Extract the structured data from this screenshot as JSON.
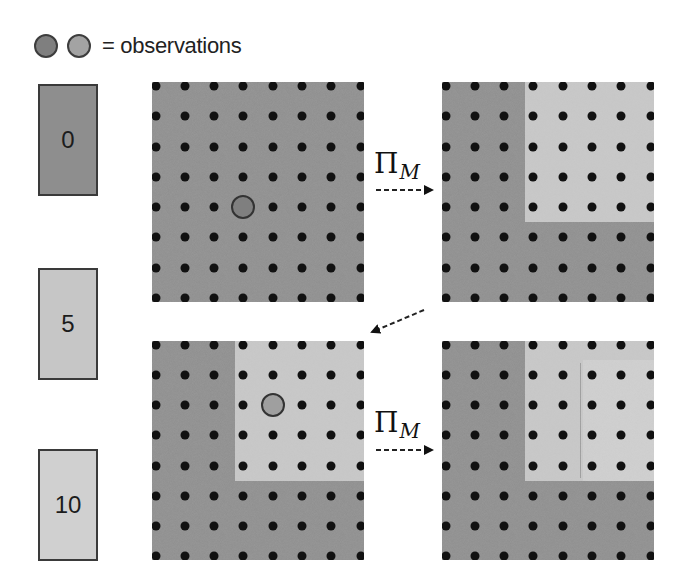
{
  "legend": {
    "markers": [
      {
        "name": "observation-marker-dark",
        "color": "#7f7f7f"
      },
      {
        "name": "observation-marker-light",
        "color": "#a3a3a3"
      }
    ],
    "text": "= observations"
  },
  "colors": {
    "value_0": "#8e8e8e",
    "value_5": "#c6c6c6",
    "value_10": "#d0d0d0",
    "grid_dark": "#8e8e8e",
    "grid_light": "#c9c9c9",
    "grid_lighter": "#d2d2d2",
    "dot": "#111111",
    "observation_dark": "#7f7f7f",
    "observation_light": "#9f9f9f"
  },
  "scale": [
    {
      "label": "0",
      "color": "#8e8e8e",
      "top": 84,
      "height": 112
    },
    {
      "label": "5",
      "color": "#c6c6c6",
      "top": 268,
      "height": 112
    },
    {
      "label": "10",
      "color": "#d0d0d0",
      "top": 449,
      "height": 112
    }
  ],
  "operator": {
    "symbol": "Π",
    "subscript": "M"
  },
  "grid": {
    "rows": 8,
    "cols": 8
  },
  "panels": [
    {
      "name": "panel-top-left",
      "position": "top-left",
      "x": 152,
      "y": 82,
      "w": 212,
      "h": 220,
      "base_color": "#8e8e8e",
      "regions": [],
      "observation": {
        "col": 4,
        "row": 5,
        "color": "#7f7f7f"
      }
    },
    {
      "name": "panel-top-right",
      "position": "top-right",
      "x": 442,
      "y": 82,
      "w": 212,
      "h": 220,
      "base_color": "#8e8e8e",
      "regions": [
        {
          "col_start": 3.7,
          "col_end": 8.5,
          "row_start": 0,
          "row_end": 5.5,
          "color": "#c9c9c9"
        }
      ],
      "observation": null
    },
    {
      "name": "panel-bottom-left",
      "position": "bottom-left",
      "x": 152,
      "y": 341,
      "w": 212,
      "h": 219,
      "base_color": "#8e8e8e",
      "regions": [
        {
          "col_start": 3.7,
          "col_end": 8.5,
          "row_start": 0,
          "row_end": 5.5,
          "color": "#c9c9c9"
        }
      ],
      "observation": {
        "col": 5,
        "row": 3,
        "color": "#9f9f9f"
      }
    },
    {
      "name": "panel-bottom-right",
      "position": "bottom-right",
      "x": 442,
      "y": 341,
      "w": 212,
      "h": 219,
      "base_color": "#8e8e8e",
      "regions": [
        {
          "col_start": 3.7,
          "col_end": 8.5,
          "row_start": 0,
          "row_end": 5.5,
          "color": "#c9c9c9"
        },
        {
          "col_start": 5.7,
          "col_end": 8.5,
          "row_start": 1.5,
          "row_end": 5.5,
          "color": "#d1d1d1"
        }
      ],
      "faint_line": {
        "col": 5.6,
        "row_start": 1.6,
        "row_end": 5.4
      },
      "observation": null
    }
  ],
  "arrows": [
    {
      "name": "projection-arrow-top",
      "from": "panel-top-left",
      "to": "panel-top-right",
      "label": true
    },
    {
      "name": "transition-arrow-diagonal",
      "from": "panel-top-right",
      "to": "panel-bottom-left",
      "label": false
    },
    {
      "name": "projection-arrow-bottom",
      "from": "panel-bottom-left",
      "to": "panel-bottom-right",
      "label": true
    }
  ]
}
